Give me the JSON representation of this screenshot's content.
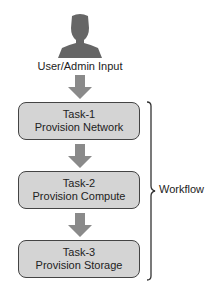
{
  "diagram": {
    "user_label": "User/Admin Input",
    "tasks": [
      {
        "id": "Task-1",
        "name": "Provision Network"
      },
      {
        "id": "Task-2",
        "name": "Provision Compute"
      },
      {
        "id": "Task-3",
        "name": "Provision Storage"
      }
    ],
    "bracket_label": "Workflow",
    "colors": {
      "icon": "#666666",
      "arrow": "#8a8a8a",
      "box_fill": "#d4d4d4",
      "box_border": "#444444"
    }
  }
}
